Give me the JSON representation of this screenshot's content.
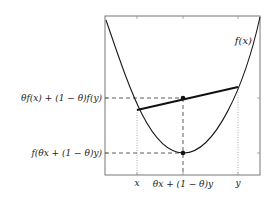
{
  "diagram": {
    "curve_label": "f(x)",
    "y_labels": {
      "chord_point": "θf(x) + (1 − θ)f(y)",
      "function_point": "f(θx + (1 − θ)y)"
    },
    "x_labels": {
      "x": "x",
      "mid": "θx + (1 − θ)y",
      "y": "y"
    },
    "colors": {
      "line": "#1a1a1a",
      "frame": "#555555",
      "guide": "#333333",
      "dotted": "#999999"
    }
  }
}
